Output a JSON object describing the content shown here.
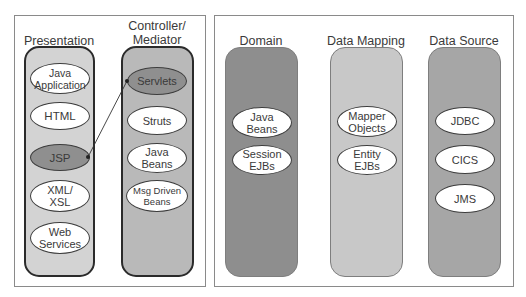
{
  "diagram": {
    "left_group": {
      "columns": [
        {
          "title": "Presentation",
          "fill": "#d3d3d3",
          "nodes": [
            {
              "label": "Java\nApplication",
              "style": "light"
            },
            {
              "label": "HTML",
              "style": "light"
            },
            {
              "label": "JSP",
              "style": "dark"
            },
            {
              "label": "XML/\nXSL",
              "style": "light"
            },
            {
              "label": "Web\nServices",
              "style": "light"
            }
          ]
        },
        {
          "title": "Controller/\nMediator",
          "fill": "#b9b9b9",
          "nodes": [
            {
              "label": "Servlets",
              "style": "dark"
            },
            {
              "label": "Struts",
              "style": "light"
            },
            {
              "label": "Java\nBeans",
              "style": "light"
            },
            {
              "label": "Msg Driven\nBeans",
              "style": "light"
            }
          ]
        }
      ],
      "connector": {
        "from": "JSP",
        "to": "Servlets"
      }
    },
    "right_group": {
      "columns": [
        {
          "title": "Domain",
          "fill": "#8e8e8e",
          "nodes": [
            {
              "label": "Java\nBeans",
              "style": "light"
            },
            {
              "label": "Session\nEJBs",
              "style": "light"
            }
          ]
        },
        {
          "title": "Data Mapping",
          "fill": "#c8c8c8",
          "nodes": [
            {
              "label": "Mapper\nObjects",
              "style": "light"
            },
            {
              "label": "Entity\nEJBs",
              "style": "light"
            }
          ]
        },
        {
          "title": "Data Source",
          "fill": "#a6a6a6",
          "nodes": [
            {
              "label": "JDBC",
              "style": "light"
            },
            {
              "label": "CICS",
              "style": "light"
            },
            {
              "label": "JMS",
              "style": "light"
            }
          ]
        }
      ]
    },
    "colors": {
      "frame_border": "#8a8a8a",
      "node_light": "#ffffff",
      "node_dark": "#8f8f8f",
      "connector": "#333333"
    }
  }
}
